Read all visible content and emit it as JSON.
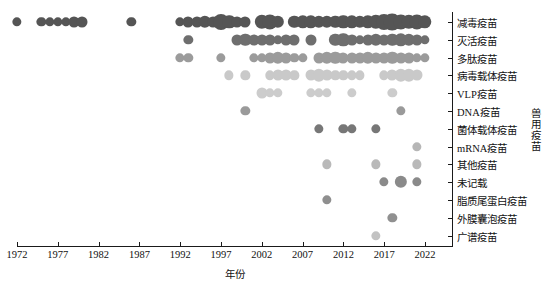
{
  "chart_data": {
    "type": "scatter",
    "title": "",
    "xlabel": "年份",
    "ylabel": "兽用疫苗",
    "xlim": [
      1970,
      2024
    ],
    "xticks": [
      1972,
      1977,
      1982,
      1987,
      1992,
      1997,
      2002,
      2007,
      2012,
      2017,
      2022
    ],
    "xticklabels": [
      "1972",
      "1977",
      "1982",
      "1987",
      "1992",
      "1997",
      "2002",
      "2007",
      "2012",
      "2017",
      "2022"
    ],
    "categories": [
      "减毒疫苗",
      "灭活疫苗",
      "多肽疫苗",
      "病毒载体疫苗",
      "VLP疫苗",
      "DNA疫苗",
      "菌体载体疫苗",
      "mRNA疫苗",
      "其他疫苗",
      "未记载",
      "脂质尾蛋白疫苗",
      "外膜囊泡疫苗",
      "广谱疫苗"
    ],
    "grid": false,
    "legend": "none",
    "size_encoding": "bubble area proportional to number of records",
    "color_encoding": "row category; darker grey for upper rows, lighter grey for lower rows",
    "row_colors": [
      "#555555",
      "#6e6e6e",
      "#9b9b9b",
      "#c9c9c9",
      "#cccccc",
      "#9a9a9a",
      "#777777",
      "#b6b6b6",
      "#b9b9b9",
      "#8a8a8a",
      "#8f8f8f",
      "#909090",
      "#c2c2c2"
    ],
    "points": [
      {
        "row": 0,
        "x": 1972,
        "n": 1
      },
      {
        "row": 0,
        "x": 1975,
        "n": 1
      },
      {
        "row": 0,
        "x": 1976,
        "n": 1
      },
      {
        "row": 0,
        "x": 1977,
        "n": 1
      },
      {
        "row": 0,
        "x": 1978,
        "n": 1
      },
      {
        "row": 0,
        "x": 1979,
        "n": 2
      },
      {
        "row": 0,
        "x": 1980,
        "n": 2
      },
      {
        "row": 0,
        "x": 1986,
        "n": 1
      },
      {
        "row": 0,
        "x": 1992,
        "n": 1
      },
      {
        "row": 0,
        "x": 1993,
        "n": 2
      },
      {
        "row": 0,
        "x": 1994,
        "n": 2
      },
      {
        "row": 0,
        "x": 1995,
        "n": 3
      },
      {
        "row": 0,
        "x": 1996,
        "n": 2
      },
      {
        "row": 0,
        "x": 1997,
        "n": 7
      },
      {
        "row": 0,
        "x": 1998,
        "n": 4
      },
      {
        "row": 0,
        "x": 1999,
        "n": 2
      },
      {
        "row": 0,
        "x": 2000,
        "n": 2
      },
      {
        "row": 0,
        "x": 2002,
        "n": 5
      },
      {
        "row": 0,
        "x": 2003,
        "n": 6
      },
      {
        "row": 0,
        "x": 2004,
        "n": 3
      },
      {
        "row": 0,
        "x": 2006,
        "n": 3
      },
      {
        "row": 0,
        "x": 2007,
        "n": 4
      },
      {
        "row": 0,
        "x": 2008,
        "n": 4
      },
      {
        "row": 0,
        "x": 2009,
        "n": 3
      },
      {
        "row": 0,
        "x": 2010,
        "n": 3
      },
      {
        "row": 0,
        "x": 2011,
        "n": 3
      },
      {
        "row": 0,
        "x": 2012,
        "n": 4
      },
      {
        "row": 0,
        "x": 2013,
        "n": 4
      },
      {
        "row": 0,
        "x": 2014,
        "n": 3
      },
      {
        "row": 0,
        "x": 2015,
        "n": 4
      },
      {
        "row": 0,
        "x": 2016,
        "n": 5
      },
      {
        "row": 0,
        "x": 2017,
        "n": 7
      },
      {
        "row": 0,
        "x": 2018,
        "n": 8
      },
      {
        "row": 0,
        "x": 2019,
        "n": 6
      },
      {
        "row": 0,
        "x": 2020,
        "n": 5
      },
      {
        "row": 0,
        "x": 2021,
        "n": 6
      },
      {
        "row": 0,
        "x": 2022,
        "n": 4
      },
      {
        "row": 1,
        "x": 1993,
        "n": 1
      },
      {
        "row": 1,
        "x": 1999,
        "n": 2
      },
      {
        "row": 1,
        "x": 2000,
        "n": 3
      },
      {
        "row": 1,
        "x": 2001,
        "n": 2
      },
      {
        "row": 1,
        "x": 2002,
        "n": 2
      },
      {
        "row": 1,
        "x": 2003,
        "n": 2
      },
      {
        "row": 1,
        "x": 2004,
        "n": 1
      },
      {
        "row": 1,
        "x": 2005,
        "n": 2
      },
      {
        "row": 1,
        "x": 2006,
        "n": 2
      },
      {
        "row": 1,
        "x": 2008,
        "n": 2
      },
      {
        "row": 1,
        "x": 2011,
        "n": 3
      },
      {
        "row": 1,
        "x": 2012,
        "n": 4
      },
      {
        "row": 1,
        "x": 2013,
        "n": 2
      },
      {
        "row": 1,
        "x": 2014,
        "n": 1
      },
      {
        "row": 1,
        "x": 2015,
        "n": 2
      },
      {
        "row": 1,
        "x": 2016,
        "n": 3
      },
      {
        "row": 1,
        "x": 2017,
        "n": 2
      },
      {
        "row": 1,
        "x": 2018,
        "n": 3
      },
      {
        "row": 1,
        "x": 2019,
        "n": 4
      },
      {
        "row": 1,
        "x": 2020,
        "n": 3
      },
      {
        "row": 1,
        "x": 2021,
        "n": 2
      },
      {
        "row": 1,
        "x": 2022,
        "n": 1
      },
      {
        "row": 2,
        "x": 1992,
        "n": 1
      },
      {
        "row": 2,
        "x": 1993,
        "n": 1
      },
      {
        "row": 2,
        "x": 1997,
        "n": 1
      },
      {
        "row": 2,
        "x": 2001,
        "n": 1
      },
      {
        "row": 2,
        "x": 2002,
        "n": 1
      },
      {
        "row": 2,
        "x": 2003,
        "n": 2
      },
      {
        "row": 2,
        "x": 2004,
        "n": 3
      },
      {
        "row": 2,
        "x": 2005,
        "n": 2
      },
      {
        "row": 2,
        "x": 2006,
        "n": 1
      },
      {
        "row": 2,
        "x": 2007,
        "n": 1
      },
      {
        "row": 2,
        "x": 2009,
        "n": 2
      },
      {
        "row": 2,
        "x": 2010,
        "n": 3
      },
      {
        "row": 2,
        "x": 2011,
        "n": 3
      },
      {
        "row": 2,
        "x": 2012,
        "n": 2
      },
      {
        "row": 2,
        "x": 2013,
        "n": 2
      },
      {
        "row": 2,
        "x": 2014,
        "n": 2
      },
      {
        "row": 2,
        "x": 2015,
        "n": 3
      },
      {
        "row": 2,
        "x": 2016,
        "n": 2
      },
      {
        "row": 2,
        "x": 2017,
        "n": 2
      },
      {
        "row": 2,
        "x": 2018,
        "n": 3
      },
      {
        "row": 2,
        "x": 2019,
        "n": 2
      },
      {
        "row": 2,
        "x": 2020,
        "n": 2
      },
      {
        "row": 2,
        "x": 2021,
        "n": 1
      },
      {
        "row": 2,
        "x": 2022,
        "n": 1
      },
      {
        "row": 3,
        "x": 1998,
        "n": 1
      },
      {
        "row": 3,
        "x": 2000,
        "n": 1
      },
      {
        "row": 3,
        "x": 2003,
        "n": 1
      },
      {
        "row": 3,
        "x": 2004,
        "n": 2
      },
      {
        "row": 3,
        "x": 2005,
        "n": 2
      },
      {
        "row": 3,
        "x": 2006,
        "n": 1
      },
      {
        "row": 3,
        "x": 2008,
        "n": 2
      },
      {
        "row": 3,
        "x": 2009,
        "n": 3
      },
      {
        "row": 3,
        "x": 2010,
        "n": 2
      },
      {
        "row": 3,
        "x": 2011,
        "n": 1
      },
      {
        "row": 3,
        "x": 2012,
        "n": 1
      },
      {
        "row": 3,
        "x": 2013,
        "n": 1
      },
      {
        "row": 3,
        "x": 2014,
        "n": 1
      },
      {
        "row": 3,
        "x": 2017,
        "n": 1
      },
      {
        "row": 3,
        "x": 2018,
        "n": 2
      },
      {
        "row": 3,
        "x": 2019,
        "n": 3
      },
      {
        "row": 3,
        "x": 2020,
        "n": 3
      },
      {
        "row": 3,
        "x": 2021,
        "n": 2
      },
      {
        "row": 4,
        "x": 2002,
        "n": 2
      },
      {
        "row": 4,
        "x": 2003,
        "n": 1
      },
      {
        "row": 4,
        "x": 2004,
        "n": 1
      },
      {
        "row": 4,
        "x": 2008,
        "n": 1
      },
      {
        "row": 4,
        "x": 2009,
        "n": 1
      },
      {
        "row": 4,
        "x": 2010,
        "n": 1
      },
      {
        "row": 4,
        "x": 2013,
        "n": 1
      },
      {
        "row": 4,
        "x": 2018,
        "n": 1
      },
      {
        "row": 5,
        "x": 2000,
        "n": 1
      },
      {
        "row": 5,
        "x": 2019,
        "n": 1
      },
      {
        "row": 6,
        "x": 2009,
        "n": 1
      },
      {
        "row": 6,
        "x": 2012,
        "n": 1
      },
      {
        "row": 6,
        "x": 2013,
        "n": 1
      },
      {
        "row": 6,
        "x": 2016,
        "n": 1
      },
      {
        "row": 7,
        "x": 2021,
        "n": 1
      },
      {
        "row": 8,
        "x": 2010,
        "n": 1
      },
      {
        "row": 8,
        "x": 2016,
        "n": 1
      },
      {
        "row": 8,
        "x": 2021,
        "n": 1
      },
      {
        "row": 9,
        "x": 2017,
        "n": 1
      },
      {
        "row": 9,
        "x": 2019,
        "n": 3
      },
      {
        "row": 9,
        "x": 2021,
        "n": 1
      },
      {
        "row": 10,
        "x": 2010,
        "n": 1
      },
      {
        "row": 11,
        "x": 2018,
        "n": 1
      },
      {
        "row": 12,
        "x": 2016,
        "n": 1
      }
    ]
  }
}
